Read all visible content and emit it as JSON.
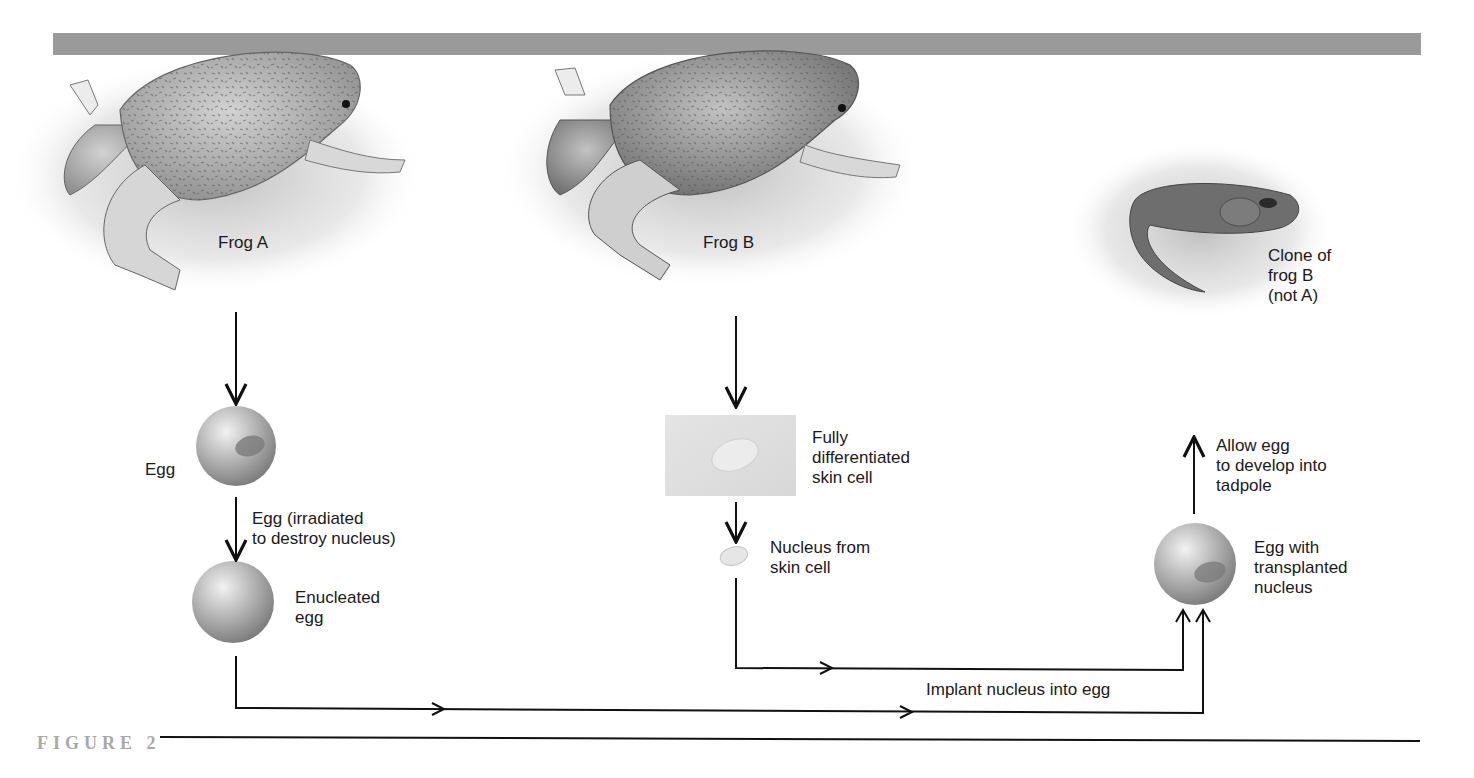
{
  "figure": {
    "caption": "FIGURE 2",
    "colors": {
      "header_bar": "#9a9a9a",
      "caption": "#a8a8a8",
      "line": "#111111",
      "egg": "#9e9e9e"
    }
  },
  "nodes": {
    "frog_a": {
      "label": "Frog A"
    },
    "frog_b": {
      "label": "Frog B"
    },
    "clone": {
      "label": "Clone of\nfrog B\n(not A)"
    },
    "egg": {
      "label": "Egg"
    },
    "irradiation_step": {
      "label": "Egg (irradiated\nto destroy nucleus)"
    },
    "enucleated_egg": {
      "label": "Enucleated\negg"
    },
    "skin_cell": {
      "label": "Fully\ndifferentiated\nskin cell"
    },
    "skin_nucleus": {
      "label": "Nucleus from\nskin cell"
    },
    "implant_step": {
      "label": "Implant nucleus into egg"
    },
    "egg_transplanted": {
      "label": "Egg with\ntransplanted\nnucleus"
    },
    "develop_step": {
      "label": "Allow egg\nto develop into\ntadpole"
    }
  }
}
